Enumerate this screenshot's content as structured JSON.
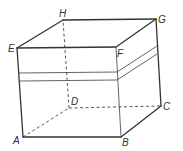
{
  "diagram": {
    "type": "cuboid",
    "vertices": {
      "A": {
        "label": "A",
        "x": 23,
        "y": 137
      },
      "B": {
        "label": "B",
        "x": 121,
        "y": 137
      },
      "C": {
        "label": "C",
        "x": 161,
        "y": 106
      },
      "D": {
        "label": "D",
        "x": 69,
        "y": 108
      },
      "E": {
        "label": "E",
        "x": 17,
        "y": 48
      },
      "F": {
        "label": "F",
        "x": 116,
        "y": 47
      },
      "G": {
        "label": "G",
        "x": 156,
        "y": 19
      },
      "H": {
        "label": "H",
        "x": 63,
        "y": 20
      }
    },
    "visible_edges": [
      "AB",
      "BC",
      "CG",
      "GH",
      "HE",
      "EA",
      "EF",
      "FG",
      "FB"
    ],
    "hidden_edges": [
      "AD",
      "DC",
      "DH"
    ],
    "band": {
      "description": "double horizontal band around front and right faces"
    },
    "colors": {
      "line": "#333333",
      "background": "#ffffff"
    }
  }
}
